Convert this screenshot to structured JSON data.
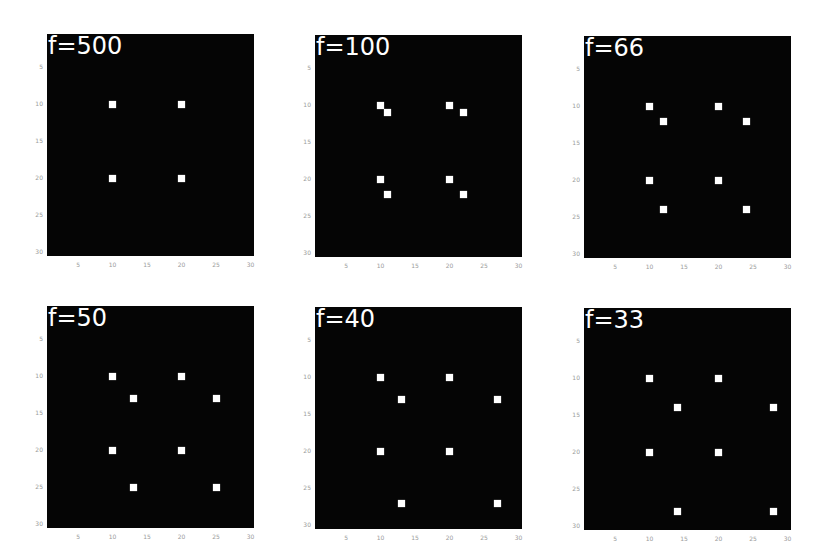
{
  "figure": {
    "background": "#ffffff",
    "panel_fill": "#050505",
    "point_color": "#ffffff",
    "label_color": "#ffffff",
    "tick_color": "#9a9a9a"
  },
  "chart_data": [
    {
      "type": "heatmap",
      "title": "f=500",
      "x_ticks": [
        "5",
        "10",
        "15",
        "20",
        "25",
        "30"
      ],
      "y_ticks": [
        "5",
        "10",
        "15",
        "20",
        "25",
        "30"
      ],
      "xlim": [
        0.5,
        30.5
      ],
      "ylim": [
        30.5,
        0.5
      ],
      "grid": false,
      "points": [
        [
          10,
          10
        ],
        [
          20,
          10
        ],
        [
          10,
          20
        ],
        [
          20,
          20
        ]
      ]
    },
    {
      "type": "heatmap",
      "title": "f=100",
      "x_ticks": [
        "5",
        "10",
        "15",
        "20",
        "25",
        "30"
      ],
      "y_ticks": [
        "5",
        "10",
        "15",
        "20",
        "25",
        "30"
      ],
      "xlim": [
        0.5,
        30.5
      ],
      "ylim": [
        30.5,
        0.5
      ],
      "grid": false,
      "points": [
        [
          10,
          10
        ],
        [
          11,
          11
        ],
        [
          20,
          10
        ],
        [
          22,
          11
        ],
        [
          10,
          20
        ],
        [
          11,
          22
        ],
        [
          20,
          20
        ],
        [
          22,
          22
        ]
      ]
    },
    {
      "type": "heatmap",
      "title": "f=66",
      "x_ticks": [
        "5",
        "10",
        "15",
        "20",
        "25",
        "30"
      ],
      "y_ticks": [
        "5",
        "10",
        "15",
        "20",
        "25",
        "30"
      ],
      "xlim": [
        0.5,
        30.5
      ],
      "ylim": [
        30.5,
        0.5
      ],
      "grid": false,
      "points": [
        [
          10,
          10
        ],
        [
          12,
          12
        ],
        [
          20,
          10
        ],
        [
          24,
          12
        ],
        [
          10,
          20
        ],
        [
          12,
          24
        ],
        [
          20,
          20
        ],
        [
          24,
          24
        ]
      ]
    },
    {
      "type": "heatmap",
      "title": "f=50",
      "x_ticks": [
        "5",
        "10",
        "15",
        "20",
        "25",
        "30"
      ],
      "y_ticks": [
        "5",
        "10",
        "15",
        "20",
        "25",
        "30"
      ],
      "xlim": [
        0.5,
        30.5
      ],
      "ylim": [
        30.5,
        0.5
      ],
      "grid": false,
      "points": [
        [
          10,
          10
        ],
        [
          13,
          13
        ],
        [
          20,
          10
        ],
        [
          25,
          13
        ],
        [
          10,
          20
        ],
        [
          13,
          25
        ],
        [
          20,
          20
        ],
        [
          25,
          25
        ]
      ]
    },
    {
      "type": "heatmap",
      "title": "f=40",
      "x_ticks": [
        "5",
        "10",
        "15",
        "20",
        "25",
        "30"
      ],
      "y_ticks": [
        "5",
        "10",
        "15",
        "20",
        "25",
        "30"
      ],
      "xlim": [
        0.5,
        30.5
      ],
      "ylim": [
        30.5,
        0.5
      ],
      "grid": false,
      "points": [
        [
          10,
          10
        ],
        [
          13,
          13
        ],
        [
          20,
          10
        ],
        [
          27,
          13
        ],
        [
          10,
          20
        ],
        [
          13,
          27
        ],
        [
          20,
          20
        ],
        [
          27,
          27
        ]
      ]
    },
    {
      "type": "heatmap",
      "title": "f=33",
      "x_ticks": [
        "5",
        "10",
        "15",
        "20",
        "25",
        "30"
      ],
      "y_ticks": [
        "5",
        "10",
        "15",
        "20",
        "25",
        "30"
      ],
      "xlim": [
        0.5,
        30.5
      ],
      "ylim": [
        30.5,
        0.5
      ],
      "grid": false,
      "points": [
        [
          10,
          10
        ],
        [
          14,
          14
        ],
        [
          20,
          10
        ],
        [
          28,
          14
        ],
        [
          10,
          20
        ],
        [
          14,
          28
        ],
        [
          20,
          20
        ],
        [
          28,
          28
        ]
      ]
    }
  ],
  "layout": {
    "panels": [
      {
        "x": 47,
        "y": 34,
        "w": 207,
        "h": 222
      },
      {
        "x": 315,
        "y": 35,
        "w": 207,
        "h": 222
      },
      {
        "x": 584,
        "y": 36,
        "w": 207,
        "h": 222
      },
      {
        "x": 47,
        "y": 306,
        "w": 207,
        "h": 222
      },
      {
        "x": 315,
        "y": 307,
        "w": 207,
        "h": 222
      },
      {
        "x": 584,
        "y": 308,
        "w": 207,
        "h": 222
      }
    ]
  }
}
